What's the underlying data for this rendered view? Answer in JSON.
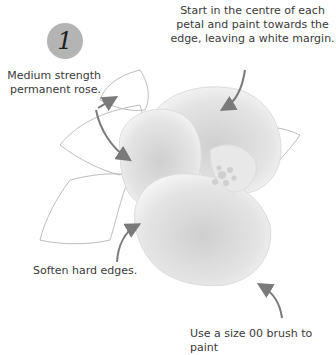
{
  "step": {
    "number": "1"
  },
  "annotations": {
    "centre_petal": "Start in the centre of each petal and paint towards the edge, leaving a white margin.",
    "rose_colour": "Medium strength permanent rose.",
    "soften": "Soften hard edges.",
    "brush": "Use a size 00 brush to paint"
  },
  "colors": {
    "badge": "#b4b4b4",
    "arrow": "#7a7a7a",
    "petal_shade": "#d6d6d6",
    "outline": "#b8b8b8"
  }
}
